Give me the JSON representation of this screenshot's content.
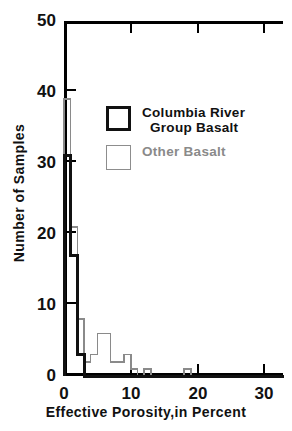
{
  "chart_data": {
    "type": "bar",
    "subtype": "histogram-step-outline",
    "title": "",
    "xlabel": "Effective Porosity,in Percent",
    "ylabel": "Number of Samples",
    "xlim": [
      0,
      32.8
    ],
    "ylim": [
      0,
      50
    ],
    "xticks": [
      0,
      10,
      20,
      30
    ],
    "xticklabels": [
      "0",
      "10",
      "20",
      "30"
    ],
    "yticks": [
      0,
      10,
      20,
      30,
      40,
      50
    ],
    "yticklabels": [
      "0",
      "10",
      "20",
      "30",
      "40",
      "50"
    ],
    "grid": false,
    "bin_width": 1,
    "legend_position": "inside-upper-left",
    "series": [
      {
        "name": "Columbia River Group Basalt",
        "color": "#111111",
        "line_width": 3,
        "bin_starts": [
          0,
          1,
          2,
          3,
          4,
          5,
          6,
          7,
          8,
          9,
          10,
          11,
          12,
          13,
          14,
          15,
          16,
          17,
          18,
          19,
          20,
          21,
          22,
          23,
          24,
          25,
          26,
          27,
          28,
          29,
          30,
          31,
          32
        ],
        "values": [
          31,
          17,
          3,
          0,
          0,
          0,
          0,
          0,
          0,
          0,
          0,
          0,
          0,
          0,
          0,
          0,
          0,
          0,
          0,
          0,
          0,
          0,
          0,
          0,
          0,
          0,
          0,
          0,
          0,
          0,
          0,
          0,
          0
        ]
      },
      {
        "name": "Other Basalt",
        "color": "#8a8a8a",
        "line_width": 1.5,
        "bin_starts": [
          0,
          1,
          2,
          3,
          4,
          5,
          6,
          7,
          8,
          9,
          10,
          11,
          12,
          13,
          14,
          15,
          16,
          17,
          18,
          19,
          20,
          21,
          22,
          23,
          24,
          25,
          26,
          27,
          28,
          29,
          30,
          31,
          32
        ],
        "values": [
          39,
          21,
          8,
          2,
          3,
          6,
          6,
          2,
          2,
          3,
          1,
          0,
          1,
          0,
          0,
          0,
          0,
          0,
          1,
          0,
          0,
          0,
          0,
          0,
          0,
          0,
          0,
          0,
          0,
          0,
          0,
          0,
          0
        ]
      }
    ]
  },
  "axes": {
    "x_title": "Effective Porosity,in Percent",
    "y_title": "Number of Samples",
    "x_tick_labels": [
      "0",
      "10",
      "20",
      "30"
    ],
    "y_tick_labels": [
      "0",
      "10",
      "20",
      "30",
      "40",
      "50"
    ]
  },
  "legend": {
    "items": [
      {
        "label_line1": "Columbia River",
        "label_line2": "Group Basalt",
        "swatch": "thick-black-square",
        "color": "#111111"
      },
      {
        "label_line1": "Other Basalt",
        "label_line2": "",
        "swatch": "thin-gray-square",
        "color": "#8a8a8a"
      }
    ]
  }
}
